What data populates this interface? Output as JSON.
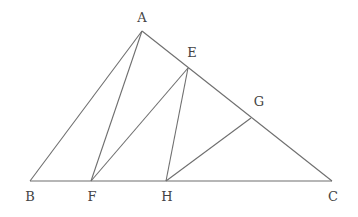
{
  "diagram": {
    "type": "geometry-triangle",
    "points": {
      "A": {
        "x": 142,
        "y": 31,
        "label": "A",
        "lx": 142,
        "ly": 22
      },
      "B": {
        "x": 30,
        "y": 181,
        "label": "B",
        "lx": 30,
        "ly": 201
      },
      "C": {
        "x": 332,
        "y": 181,
        "label": "C",
        "lx": 333,
        "ly": 201
      },
      "E": {
        "x": 188,
        "y": 68,
        "label": "E",
        "lx": 192,
        "ly": 57
      },
      "F": {
        "x": 91,
        "y": 181,
        "label": "F",
        "lx": 92,
        "ly": 201
      },
      "G": {
        "x": 251,
        "y": 118,
        "label": "G",
        "lx": 259,
        "ly": 106
      },
      "H": {
        "x": 166,
        "y": 181,
        "label": "H",
        "lx": 167,
        "ly": 201
      }
    },
    "segments": [
      [
        "A",
        "B"
      ],
      [
        "B",
        "C"
      ],
      [
        "A",
        "C"
      ],
      [
        "A",
        "F"
      ],
      [
        "F",
        "E"
      ],
      [
        "E",
        "H"
      ],
      [
        "H",
        "G"
      ]
    ],
    "line_color": "#6e6e6e",
    "label_color": "#444444"
  }
}
